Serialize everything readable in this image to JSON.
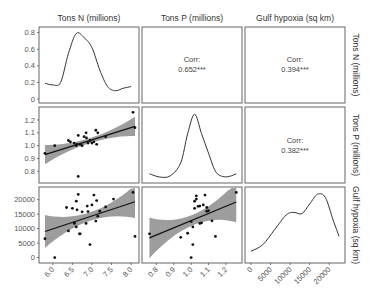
{
  "chart_data": {
    "type": "scatter",
    "title": "",
    "layout": "pairs-plot 3x3",
    "variables": [
      "Tons N (millions)",
      "Tons P (millions)",
      "Gulf hypoxia (sq km)"
    ],
    "column_titles": [
      "Tons N (millions)",
      "Tons P (millions)",
      "Gulf hypoxia (sq km)"
    ],
    "row_labels": [
      "Tons N (millions)",
      "Tons P (millions)",
      "Gulf hypoxia (sq km)"
    ],
    "correlations": [
      {
        "row": 1,
        "col": 2,
        "label": "Corr:",
        "value": "0.652***"
      },
      {
        "row": 1,
        "col": 3,
        "label": "Corr:",
        "value": "0.394***"
      },
      {
        "row": 2,
        "col": 3,
        "label": "Corr:",
        "value": "0.382***"
      }
    ],
    "axes": {
      "tons_n": {
        "range": [
          5.75,
          8.1
        ],
        "ticks": [
          "6.0",
          "6.5",
          "7.0",
          "7.5",
          "8.0"
        ]
      },
      "tons_p": {
        "range": [
          0.74,
          1.27
        ],
        "ticks": [
          "0.8",
          "0.9",
          "1.0",
          "1.1",
          "1.2"
        ]
      },
      "hypoxia": {
        "range": [
          -500,
          23000
        ],
        "ticks": [
          "0",
          "5000",
          "10000",
          "15000",
          "20000"
        ]
      },
      "density_n": {
        "range": [
          0,
          0.82
        ],
        "ticks": [
          "0",
          "0.2",
          "0.4",
          "0.6",
          "0.8"
        ]
      }
    },
    "density_tons_n": {
      "x": [
        5.8,
        6.0,
        6.2,
        6.4,
        6.6,
        6.8,
        7.0,
        7.2,
        7.4,
        7.6,
        7.8,
        8.0
      ],
      "y": [
        0.19,
        0.17,
        0.2,
        0.55,
        0.79,
        0.74,
        0.62,
        0.35,
        0.15,
        0.1,
        0.13,
        0.15
      ]
    },
    "density_tons_p": {
      "x": [
        0.76,
        0.82,
        0.88,
        0.94,
        0.98,
        1.02,
        1.06,
        1.1,
        1.14,
        1.18,
        1.22,
        1.26
      ],
      "y": [
        0.08,
        0.03,
        0.05,
        0.25,
        0.7,
        1.0,
        0.7,
        0.4,
        0.12,
        0.04,
        0.04,
        0.08
      ]
    },
    "density_hypoxia": {
      "x": [
        0,
        3000,
        6000,
        9000,
        11000,
        13000,
        15000,
        17000,
        19000,
        21000,
        22500
      ],
      "y": [
        0.12,
        0.22,
        0.45,
        0.68,
        0.72,
        0.7,
        0.85,
        1.0,
        0.95,
        0.6,
        0.35
      ]
    },
    "scatter_p_vs_n": {
      "x": [
        5.8,
        6.05,
        6.4,
        6.45,
        6.55,
        6.6,
        6.62,
        6.65,
        6.7,
        6.75,
        6.8,
        6.85,
        6.86,
        6.9,
        6.95,
        7.0,
        7.05,
        7.1,
        7.12,
        7.15,
        7.35,
        8.05,
        8.1,
        6.65
      ],
      "y": [
        0.94,
        1.0,
        1.04,
        1.03,
        1.02,
        1.0,
        1.01,
        1.08,
        1.01,
        1.0,
        1.07,
        1.1,
        1.06,
        1.02,
        1.04,
        1.02,
        1.03,
        1.12,
        1.01,
        1.1,
        1.07,
        1.26,
        1.14,
        0.76
      ],
      "fit": {
        "x": [
          5.8,
          8.1
        ],
        "y": [
          0.93,
          1.15
        ]
      }
    },
    "scatter_hypoxia_vs_n": {
      "x": [
        5.8,
        6.05,
        6.35,
        6.4,
        6.5,
        6.55,
        6.6,
        6.62,
        6.65,
        6.68,
        6.7,
        6.75,
        6.85,
        6.88,
        6.9,
        6.95,
        7.0,
        7.05,
        7.1,
        7.12,
        7.15,
        7.2,
        7.35,
        7.55,
        8.05,
        8.1,
        6.6,
        6.55
      ],
      "y": [
        6500,
        0,
        17300,
        9200,
        17000,
        11800,
        10600,
        16500,
        21800,
        8200,
        8200,
        15800,
        11800,
        17800,
        15900,
        4500,
        18200,
        21600,
        12600,
        19700,
        14300,
        16000,
        17500,
        20200,
        22500,
        7300,
        19500,
        12000
      ],
      "fit": {
        "x": [
          5.8,
          8.1
        ],
        "y": [
          9000,
          19300
        ]
      }
    },
    "scatter_hypoxia_vs_p": {
      "x": [
        0.76,
        0.94,
        0.98,
        1.0,
        1.01,
        1.02,
        1.02,
        1.03,
        1.04,
        1.05,
        1.06,
        1.07,
        1.08,
        1.09,
        1.1,
        1.12,
        1.14,
        1.26,
        1.0,
        1.01,
        1.03,
        1.05,
        1.09
      ],
      "y": [
        8200,
        7000,
        8400,
        12500,
        10600,
        19500,
        17000,
        21300,
        17700,
        17800,
        12000,
        18200,
        21600,
        17300,
        16200,
        12700,
        7300,
        22500,
        0,
        4500,
        20200,
        11800,
        16000
      ],
      "fit": {
        "x": [
          0.76,
          1.26
        ],
        "y": [
          6800,
          19200
        ]
      }
    }
  }
}
